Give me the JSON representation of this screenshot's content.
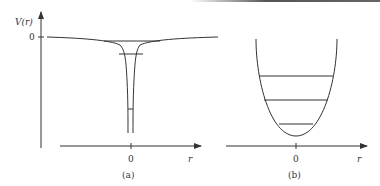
{
  "figure": {
    "panel_a": {
      "caption": "(a)",
      "y_axis_label": "V(r)",
      "y_tick_zero": "0",
      "x_tick_zero": "0",
      "x_axis_label": "r",
      "description": "Coulomb-like potential well: flat at V=0 far away, dropping sharply to a narrow deep well at r=0, with 3 horizontal energy levels"
    },
    "panel_b": {
      "caption": "(b)",
      "x_tick_zero": "0",
      "x_axis_label": "r",
      "description": "Parabolic harmonic-oscillator potential with 3 equally spaced horizontal energy levels"
    },
    "colors": {
      "line": "#333333",
      "background": "#ffffff"
    }
  }
}
